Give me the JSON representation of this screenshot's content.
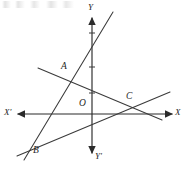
{
  "figure": {
    "title_note": "",
    "background_color": "#ffffff",
    "ink_color": "#2b2b2b",
    "width": 185,
    "height": 169,
    "axes": {
      "x_axis": {
        "name": "x-axis",
        "negative_label": "X'",
        "positive_label": "X",
        "y_position": 114,
        "x_start": 18,
        "x_end": 172,
        "negative_label_x": 4,
        "negative_label_y": 108,
        "positive_label_x": 175,
        "positive_label_y": 108
      },
      "y_axis": {
        "name": "y-axis",
        "positive_label": "Y",
        "negative_label": "Y'",
        "x_position": 92,
        "y_start": 18,
        "y_end": 153,
        "positive_label_x": 88,
        "positive_label_y": 4,
        "negative_label_x": 95,
        "negative_label_y": 152
      },
      "origin_label": "O",
      "origin_label_x": 79,
      "origin_label_y": 100
    },
    "ticks": {
      "y_axis_ticks": [
        33,
        67,
        93
      ],
      "x_axis_ticks": []
    },
    "points": [
      {
        "label": "A",
        "x": 68,
        "y": 76,
        "label_x": 61,
        "label_y": 62
      },
      {
        "label": "B",
        "x": 31,
        "y": 147,
        "label_x": 33,
        "label_y": 147
      },
      {
        "label": "C",
        "x": 137,
        "y": 105,
        "label_x": 126,
        "label_y": 92
      }
    ],
    "lines": [
      {
        "name": "line-AB-steep",
        "x1": 113,
        "y1": 12,
        "x2": 24,
        "y2": 160
      },
      {
        "name": "line-AC-descending",
        "x1": 38,
        "y1": 68,
        "x2": 162,
        "y2": 120
      },
      {
        "name": "line-BC-ascending",
        "x1": 17,
        "y1": 156,
        "x2": 170,
        "y2": 92
      }
    ]
  }
}
